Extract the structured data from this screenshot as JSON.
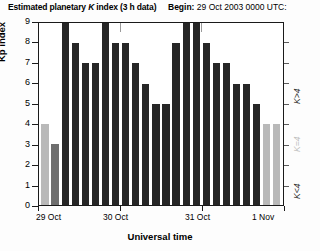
{
  "header": {
    "title_pre": "Estimated planetary ",
    "title_k": "K",
    "title_post": " index (3 h data)",
    "begin_label": "Begin:",
    "begin_value": "29 Oct 2003 0000 UTC:"
  },
  "axes": {
    "ylabel": "Kp index",
    "xlabel": "Universal time",
    "yticks": [
      "0",
      "1",
      "2",
      "3",
      "4",
      "5",
      "6",
      "7",
      "8",
      "9"
    ],
    "xticks": [
      "29 Oct",
      "30 Oct",
      "31 Oct",
      "1 Nov"
    ]
  },
  "legend": {
    "high": "K>4",
    "mid": "K=4",
    "low": "K<4"
  },
  "colors": {
    "low": "#b9b9b9",
    "mid": "#6e6e6e",
    "high": "#262626",
    "axis": "#1a1a1a"
  },
  "chart_data": {
    "type": "bar",
    "title": "Estimated planetary K index (3 h data)",
    "subtitle": "Begin: 29 Oct 2003 0000 UTC:",
    "xlabel": "Universal time",
    "ylabel": "Kp index",
    "ylim": [
      0,
      9
    ],
    "grid": false,
    "legend_position": "right",
    "categories": [
      "29 Oct 00",
      "29 Oct 03",
      "29 Oct 06",
      "29 Oct 09",
      "29 Oct 12",
      "29 Oct 15",
      "29 Oct 18",
      "29 Oct 21",
      "30 Oct 00",
      "30 Oct 03",
      "30 Oct 06",
      "30 Oct 09",
      "30 Oct 12",
      "30 Oct 15",
      "30 Oct 18",
      "30 Oct 21",
      "31 Oct 00",
      "31 Oct 03",
      "31 Oct 06",
      "31 Oct 09",
      "31 Oct 12",
      "31 Oct 15",
      "31 Oct 18",
      "31 Oct 21"
    ],
    "values": [
      4,
      3,
      9,
      8,
      7,
      7,
      9,
      8,
      8,
      7,
      6,
      5,
      5,
      8,
      9,
      9,
      8,
      7,
      7,
      6,
      6,
      5,
      4,
      4
    ],
    "bar_classes": [
      "lt",
      "md",
      "dk",
      "dk",
      "dk",
      "dk",
      "dk",
      "dk",
      "dk",
      "dk",
      "dk",
      "dk",
      "dk",
      "dk",
      "dk",
      "dk",
      "dk",
      "dk",
      "dk",
      "dk",
      "dk",
      "dk",
      "lt",
      "lt"
    ]
  }
}
